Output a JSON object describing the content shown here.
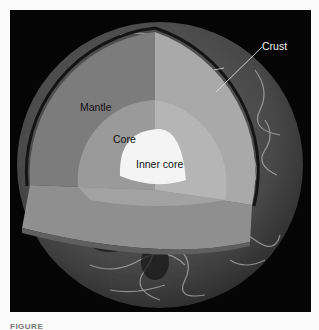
{
  "figure": {
    "type": "earth-cutaway-diagram",
    "labels": {
      "crust": "Crust",
      "mantle": "Mantle",
      "core": "Core",
      "inner_core": "Inner core"
    },
    "caption": "FIGURE"
  },
  "colors": {
    "background": "#050505",
    "page": "#fbfbfb",
    "globe_surface": "#4a4a4a",
    "crust_band": "#1a1a1a",
    "mantle_left": "#7c7c7c",
    "mantle_right": "#a9a9a9",
    "mantle_floor": "#8f8f8f",
    "core_left": "#9a9a9a",
    "core_right": "#b5b5b5",
    "inner_core": "#f4f4f4",
    "leader_line": "#e0e0e0"
  }
}
